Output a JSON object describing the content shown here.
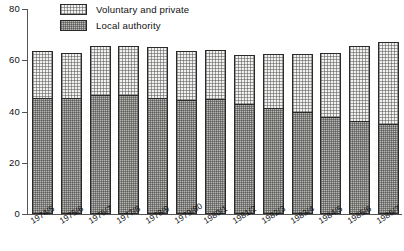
{
  "chart_data": {
    "type": "bar",
    "subtype": "stacked-vertical",
    "title": "",
    "xlabel": "",
    "ylabel": "",
    "ylim": [
      0,
      80
    ],
    "yticks": [
      0,
      20,
      40,
      60,
      80
    ],
    "ytick_labels": [
      "0",
      "20",
      "40",
      "60",
      "80"
    ],
    "grid": false,
    "legend_position": "top-left-inside",
    "categories": [
      "1974/5",
      "1975/6",
      "1976/7",
      "1977/8",
      "1978/9",
      "1979/80",
      "1980/1",
      "1981/2",
      "1982/3",
      "1983/4",
      "1984/5",
      "1985/6",
      "1986/7"
    ],
    "series": [
      {
        "name": "Local authority",
        "color": "#b9b9b6",
        "values": [
          45.5,
          45.5,
          46.5,
          46.5,
          45.5,
          44.5,
          45.0,
          43.0,
          41.5,
          40.0,
          38.0,
          36.5,
          35.0
        ]
      },
      {
        "name": "Voluntary and private",
        "color": "#f2f2f0",
        "values": [
          18.0,
          17.5,
          19.0,
          19.0,
          19.5,
          19.0,
          19.0,
          19.0,
          21.0,
          22.5,
          25.0,
          29.0,
          32.0
        ]
      }
    ],
    "totals": [
      63.5,
      63.0,
      65.5,
      65.5,
      65.0,
      63.5,
      64.0,
      62.0,
      62.5,
      62.5,
      63.0,
      65.5,
      67.0
    ]
  },
  "legend": {
    "items": [
      {
        "label": "Voluntary and private",
        "swatch": "vp"
      },
      {
        "label": "Local authority",
        "swatch": "la"
      }
    ]
  }
}
